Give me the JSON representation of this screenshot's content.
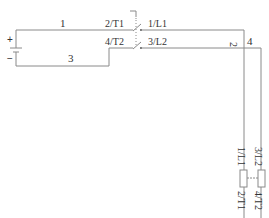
{
  "diagram": {
    "type": "wiring-schematic",
    "battery": {
      "plus": "+",
      "minus": "−"
    },
    "wires": {
      "w1": "1",
      "w2": "2",
      "w3": "3",
      "w4": "4"
    },
    "switch": {
      "terminals_left": [
        "2/T1",
        "4/T2"
      ],
      "terminals_right": [
        "1/L1",
        "3/L2"
      ]
    },
    "relay": {
      "top_labels": [
        "1/L1",
        "3/L2"
      ],
      "bottom_labels": [
        "2/T1",
        "4/T2"
      ]
    },
    "colors": {
      "line": "#8a8a8a",
      "text": "#333333"
    }
  }
}
